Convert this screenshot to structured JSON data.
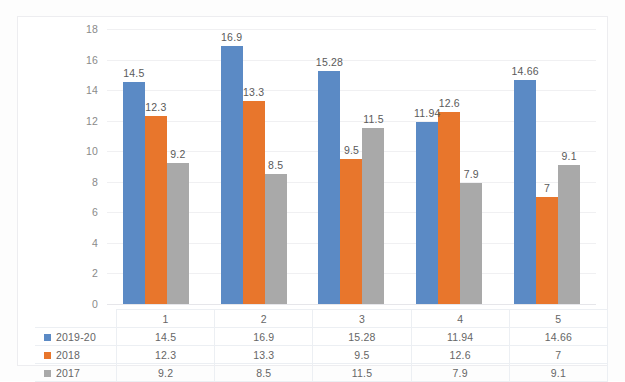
{
  "chart_data": {
    "type": "bar",
    "title": "",
    "xlabel": "",
    "ylabel": "",
    "categories": [
      "1",
      "2",
      "3",
      "4",
      "5"
    ],
    "ylim": [
      0,
      18
    ],
    "yticks": [
      "0",
      "2",
      "4",
      "6",
      "8",
      "10",
      "12",
      "14",
      "16",
      "18"
    ],
    "grid": true,
    "legend_position": "table-left",
    "series": [
      {
        "name": "2019-20",
        "color": "#5b8ac5",
        "values": [
          14.5,
          16.9,
          15.28,
          11.94,
          14.66
        ],
        "labels": [
          "14.5",
          "16.9",
          "15.28",
          "11.94",
          "14.66"
        ]
      },
      {
        "name": "2018",
        "color": "#e8762c",
        "values": [
          12.3,
          13.3,
          9.5,
          12.6,
          7
        ],
        "labels": [
          "12.3",
          "13.3",
          "9.5",
          "12.6",
          "7"
        ]
      },
      {
        "name": "2017",
        "color": "#a9a9a9",
        "values": [
          9.2,
          8.5,
          11.5,
          7.9,
          9.1
        ],
        "labels": [
          "9.2",
          "8.5",
          "11.5",
          "7.9",
          "9.1"
        ]
      }
    ]
  },
  "data_table": {
    "header": [
      "",
      "1",
      "2",
      "3",
      "4",
      "5"
    ],
    "rows": [
      {
        "label": "2019-20",
        "swatch": "#5b8ac5",
        "cells": [
          "14.5",
          "16.9",
          "15.28",
          "11.94",
          "14.66"
        ]
      },
      {
        "label": "2018",
        "swatch": "#e8762c",
        "cells": [
          "12.3",
          "13.3",
          "9.5",
          "12.6",
          "7"
        ]
      },
      {
        "label": "2017",
        "swatch": "#a9a9a9",
        "cells": [
          "9.2",
          "8.5",
          "11.5",
          "7.9",
          "9.1"
        ]
      }
    ]
  }
}
